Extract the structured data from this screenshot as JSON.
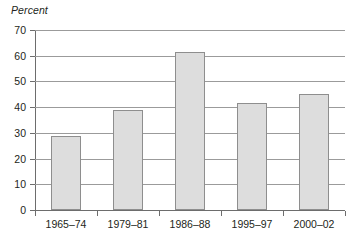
{
  "chart_data": {
    "type": "bar",
    "title": "",
    "subtitle": "",
    "xlabel": "",
    "ylabel": "Percent",
    "categories": [
      "1965–74",
      "1979–81",
      "1986–88",
      "1995–97",
      "2000–02"
    ],
    "values": [
      28.7,
      39.0,
      61.5,
      41.7,
      45.3
    ],
    "ylim": [
      0,
      70
    ],
    "ytick_labels": [
      "0",
      "10",
      "20",
      "30",
      "40",
      "50",
      "60",
      "70"
    ],
    "ytick_values": [
      0,
      10,
      20,
      30,
      40,
      50,
      60,
      70
    ],
    "grid": "horizontal",
    "legend": "none",
    "annotations": [],
    "colors": {
      "bar_fill": "#dddddd",
      "bar_border": "#8e8e8e",
      "gridline": "#9b9b9b",
      "axis": "#6d6d6d",
      "text": "#231f20",
      "background": "#ffffff"
    }
  }
}
